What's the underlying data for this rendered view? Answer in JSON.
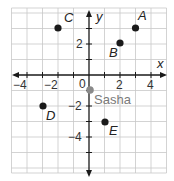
{
  "diagram": {
    "type": "coordinate-plane",
    "x_axis_label": "x",
    "y_axis_label": "y",
    "origin_label": "0",
    "x_range": [
      -5,
      5
    ],
    "y_range": [
      -6,
      4
    ],
    "x_tick_labels": [
      {
        "value": -4,
        "label": "−4"
      },
      {
        "value": -2,
        "label": "−2"
      },
      {
        "value": 2,
        "label": "2"
      },
      {
        "value": 4,
        "label": "4"
      }
    ],
    "y_tick_labels": [
      {
        "value": 2,
        "label": "2"
      },
      {
        "value": -2,
        "label": "−2"
      },
      {
        "value": -4,
        "label": "−4"
      }
    ],
    "points": [
      {
        "label": "A",
        "x": 3,
        "y": 3,
        "color": "#1a1a1a"
      },
      {
        "label": "B",
        "x": 2,
        "y": 2,
        "color": "#1a1a1a"
      },
      {
        "label": "C",
        "x": -2,
        "y": 3,
        "color": "#1a1a1a"
      },
      {
        "label": "D",
        "x": -3,
        "y": -2,
        "color": "#1a1a1a"
      },
      {
        "label": "E",
        "x": 1,
        "y": -3,
        "color": "#1a1a1a"
      },
      {
        "label": "Sasha",
        "x": 0,
        "y": -1,
        "color": "#8a8a8a"
      }
    ]
  },
  "colors": {
    "grid": "#c8c8c8",
    "axis": "#1a1a1a",
    "point": "#1a1a1a",
    "sasha_point": "#8a8a8a"
  }
}
